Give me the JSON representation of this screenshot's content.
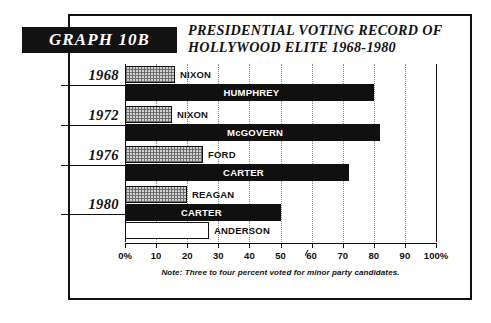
{
  "badge": {
    "label": "GRAPH 10B"
  },
  "title": {
    "line1": "PRESIDENTIAL VOTING RECORD OF",
    "line2": "HOLLYWOOD ELITE 1968-1980"
  },
  "note": "Note: Three to four percent voted for minor party candidates.",
  "axis": {
    "ticklabels": [
      "0%",
      "10",
      "20",
      "30",
      "40",
      "50",
      "60",
      "70",
      "80",
      "90",
      "100%"
    ]
  },
  "groups": [
    {
      "year": "1968"
    },
    {
      "year": "1972"
    },
    {
      "year": "1976"
    },
    {
      "year": "1980"
    }
  ],
  "bars": [
    {
      "label": "NIXON",
      "value": 16,
      "style": "hatch",
      "label_pos": "out"
    },
    {
      "label": "HUMPHREY",
      "value": 80,
      "style": "solid",
      "label_pos": "in"
    },
    {
      "label": "NIXON",
      "value": 15,
      "style": "hatch",
      "label_pos": "out"
    },
    {
      "label": "McGOVERN",
      "value": 82,
      "style": "solid",
      "label_pos": "in"
    },
    {
      "label": "FORD",
      "value": 25,
      "style": "hatch",
      "label_pos": "out"
    },
    {
      "label": "CARTER",
      "value": 72,
      "style": "solid",
      "label_pos": "in"
    },
    {
      "label": "REAGAN",
      "value": 20,
      "style": "hatch",
      "label_pos": "out"
    },
    {
      "label": "CARTER",
      "value": 50,
      "style": "solid",
      "label_pos": "in"
    },
    {
      "label": "ANDERSON",
      "value": 27,
      "style": "open",
      "label_pos": "out"
    }
  ],
  "colors": {
    "ink": "#111111",
    "solid_bar": "#101010",
    "hatch_bar": "#d2d2d2",
    "open_bar": "#ffffff",
    "grid": "#8d8d8d",
    "paper": "#ffffff"
  },
  "chart_data": {
    "type": "bar",
    "orientation": "horizontal",
    "title": "PRESIDENTIAL VOTING RECORD OF HOLLYWOOD ELITE 1968-1980",
    "badge": "GRAPH 10B",
    "xlabel": "",
    "ylabel": "",
    "xlim": [
      0,
      100
    ],
    "xticks": [
      0,
      10,
      20,
      30,
      40,
      50,
      60,
      70,
      80,
      90,
      100
    ],
    "xticklabels": [
      "0%",
      "10",
      "20",
      "30",
      "40",
      "50",
      "60",
      "70",
      "80",
      "90",
      "100%"
    ],
    "grid": true,
    "legend": "none",
    "units": "percent",
    "annotation": "Note: Three to four percent voted for minor party candidates.",
    "categories": [
      "1968",
      "1972",
      "1976",
      "1980"
    ],
    "bars": [
      {
        "group": "1968",
        "candidate": "NIXON",
        "value": 16,
        "fill": "stippled"
      },
      {
        "group": "1968",
        "candidate": "HUMPHREY",
        "value": 80,
        "fill": "solid-black"
      },
      {
        "group": "1972",
        "candidate": "NIXON",
        "value": 15,
        "fill": "stippled"
      },
      {
        "group": "1972",
        "candidate": "McGOVERN",
        "value": 82,
        "fill": "solid-black"
      },
      {
        "group": "1976",
        "candidate": "FORD",
        "value": 25,
        "fill": "stippled"
      },
      {
        "group": "1976",
        "candidate": "CARTER",
        "value": 72,
        "fill": "solid-black"
      },
      {
        "group": "1980",
        "candidate": "REAGAN",
        "value": 20,
        "fill": "stippled"
      },
      {
        "group": "1980",
        "candidate": "CARTER",
        "value": 50,
        "fill": "solid-black"
      },
      {
        "group": "1980",
        "candidate": "ANDERSON",
        "value": 27,
        "fill": "white-outline"
      }
    ]
  }
}
